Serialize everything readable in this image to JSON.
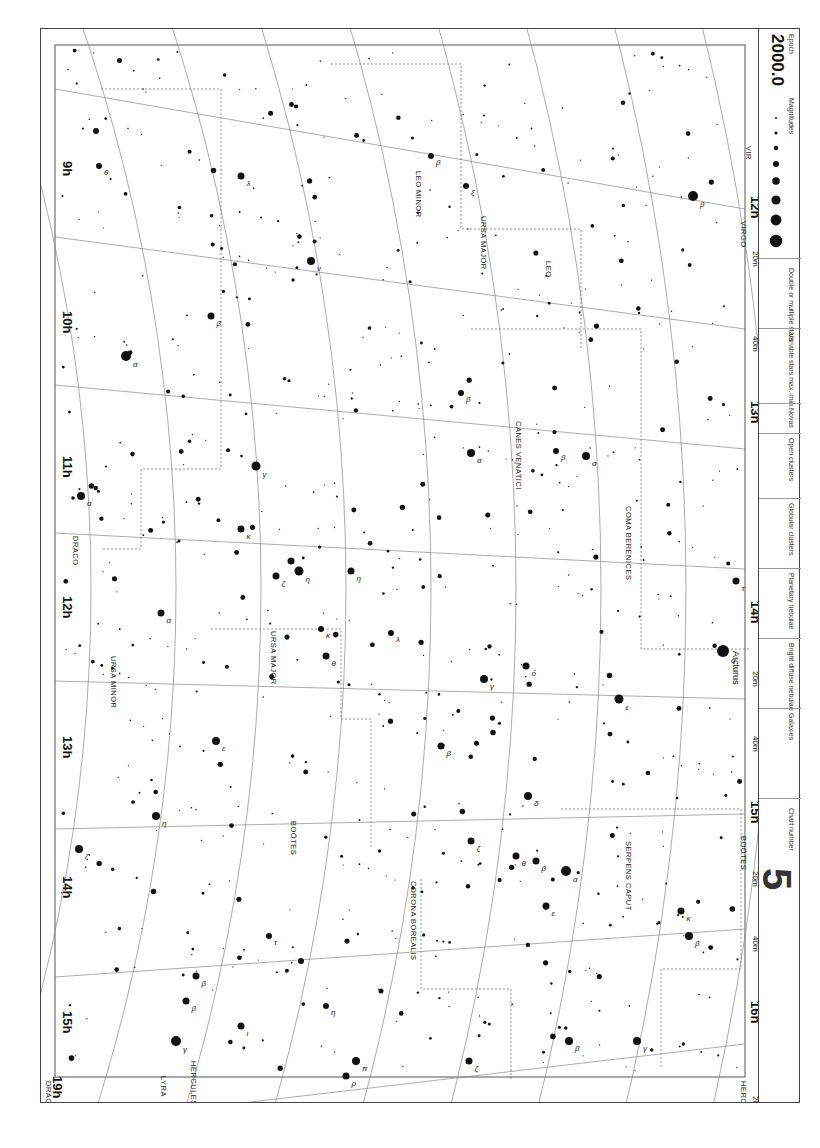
{
  "legend": {
    "epoch_label": "Epoch",
    "epoch_value": "2000.0",
    "magnitudes_label": "Magnitudes",
    "magnitudes": [
      "6",
      "5",
      "4",
      "3",
      "2",
      "1",
      "0",
      "-1"
    ],
    "double_label": "Double or multiple stars",
    "variable_label": "Variable stars max.-min.",
    "variable_ranges": [
      "6 – <6",
      "4 – <6",
      "4 – 5",
      "3 – 6"
    ],
    "novas_label": "Novas",
    "novas_example": "+N1901",
    "open_clusters_label": "Open clusters",
    "open_clusters": [
      "<30'",
      "> 30' drawn to scale"
    ],
    "globular_label": "Globular clusters",
    "globular": [
      "<5'",
      "5'-10'",
      ">10'"
    ],
    "planetary_label": "Planetary nebulae",
    "planetary": [
      "<30\"",
      "30\"-60\"",
      ">60\""
    ],
    "diffuse_label": "Bright diffuse nebulae",
    "diffuse": [
      "<10'",
      ">10' drawn to scale"
    ],
    "galaxies_label": "Galaxies",
    "galaxies": [
      "<10'",
      "10'-20'",
      "20'-30'",
      ">30' drawn to scale"
    ],
    "chart_number_label": "Chart number",
    "chart_number": "5"
  },
  "chart": {
    "ra_labels": [
      {
        "text": "9h",
        "x": 62,
        "y": 160
      },
      {
        "text": "10h",
        "x": 62,
        "y": 310
      },
      {
        "text": "11h",
        "x": 62,
        "y": 455
      },
      {
        "text": "12h",
        "x": 62,
        "y": 595
      },
      {
        "text": "13h",
        "x": 62,
        "y": 735
      },
      {
        "text": "14h",
        "x": 62,
        "y": 875
      },
      {
        "text": "15h",
        "x": 62,
        "y": 1010
      },
      {
        "text": "19h",
        "x": 52,
        "y": 1075
      }
    ],
    "ra_bottom_labels": [
      {
        "text": "12h",
        "x": 750,
        "y": 195
      },
      {
        "text": "13h",
        "x": 750,
        "y": 400
      },
      {
        "text": "14h",
        "x": 750,
        "y": 600
      },
      {
        "text": "15h",
        "x": 750,
        "y": 800
      },
      {
        "text": "16h",
        "x": 750,
        "y": 1000
      },
      {
        "text": "20m",
        "x": 752,
        "y": 250
      },
      {
        "text": "40m",
        "x": 752,
        "y": 335
      },
      {
        "text": "20m",
        "x": 752,
        "y": 670
      },
      {
        "text": "40m",
        "x": 752,
        "y": 735
      },
      {
        "text": "20m",
        "x": 752,
        "y": 870
      },
      {
        "text": "40m",
        "x": 752,
        "y": 935
      },
      {
        "text": "20m",
        "x": 752,
        "y": 1095
      }
    ],
    "dec_labels": [
      {
        "text": "+50°",
        "x": 100,
        "y": 1115
      },
      {
        "text": "+45°",
        "x": 205,
        "y": 1115
      },
      {
        "text": "+40°",
        "x": 290,
        "y": 1115
      },
      {
        "text": "+35°",
        "x": 370,
        "y": 1115
      },
      {
        "text": "+30°",
        "x": 460,
        "y": 1115
      },
      {
        "text": "+25°",
        "x": 545,
        "y": 1115
      },
      {
        "text": "+20°",
        "x": 625,
        "y": 1115
      },
      {
        "text": "+15°",
        "x": 700,
        "y": 1115
      },
      {
        "text": "+10°",
        "x": 760,
        "y": 1115
      }
    ],
    "constellations": [
      {
        "name": "DRACO",
        "x": 72,
        "y": 535,
        "rot": 90
      },
      {
        "name": "DRACO",
        "x": 45,
        "y": 1080,
        "rot": 90
      },
      {
        "name": "URSA MINOR",
        "x": 110,
        "y": 655,
        "rot": 90
      },
      {
        "name": "URSA MAJOR",
        "x": 270,
        "y": 630,
        "rot": 90
      },
      {
        "name": "BOÖTES",
        "x": 290,
        "y": 820,
        "rot": 90
      },
      {
        "name": "BOÖTES",
        "x": 740,
        "y": 835,
        "rot": 90
      },
      {
        "name": "LEO MINOR",
        "x": 415,
        "y": 170,
        "rot": 90
      },
      {
        "name": "URSA MAJOR",
        "x": 480,
        "y": 215,
        "rot": 90
      },
      {
        "name": "LEO",
        "x": 545,
        "y": 260,
        "rot": 90
      },
      {
        "name": "CANES VENATICI",
        "x": 515,
        "y": 420,
        "rot": 90
      },
      {
        "name": "COMA BERENICES",
        "x": 625,
        "y": 505,
        "rot": 90
      },
      {
        "name": "VIRGO",
        "x": 740,
        "y": 220,
        "rot": 90
      },
      {
        "name": "VIR",
        "x": 745,
        "y": 145,
        "rot": 90
      },
      {
        "name": "CORONA BOREALIS",
        "x": 410,
        "y": 880,
        "rot": 90
      },
      {
        "name": "SERPENS CAPUT",
        "x": 625,
        "y": 840,
        "rot": 90
      },
      {
        "name": "HERCULES",
        "x": 190,
        "y": 1060,
        "rot": 90
      },
      {
        "name": "HERCULES",
        "x": 740,
        "y": 1080,
        "rot": 90
      },
      {
        "name": "LYRA",
        "x": 160,
        "y": 1075,
        "rot": 90
      }
    ],
    "named_stars": [
      {
        "name": "Arcturus",
        "x": 722,
        "y": 650
      }
    ],
    "stars": [
      {
        "x": 125,
        "y": 355,
        "r": 5,
        "l": "α"
      },
      {
        "x": 80,
        "y": 495,
        "r": 4,
        "l": "α"
      },
      {
        "x": 160,
        "y": 612,
        "r": 3.5,
        "l": "α"
      },
      {
        "x": 255,
        "y": 465,
        "r": 4.5,
        "l": "γ"
      },
      {
        "x": 240,
        "y": 528,
        "r": 3.5,
        "l": "κ"
      },
      {
        "x": 290,
        "y": 560,
        "r": 3.5,
        "l": "ε"
      },
      {
        "x": 275,
        "y": 575,
        "r": 3.5,
        "l": "ζ"
      },
      {
        "x": 298,
        "y": 570,
        "r": 4.5,
        "l": "η"
      },
      {
        "x": 210,
        "y": 315,
        "r": 3.5,
        "l": "β"
      },
      {
        "x": 240,
        "y": 175,
        "r": 3.5,
        "l": "λ"
      },
      {
        "x": 310,
        "y": 260,
        "r": 4,
        "l": "ν"
      },
      {
        "x": 350,
        "y": 570,
        "r": 3.5,
        "l": "η"
      },
      {
        "x": 390,
        "y": 632,
        "r": 3,
        "l": "λ"
      },
      {
        "x": 320,
        "y": 628,
        "r": 3,
        "l": "κ"
      },
      {
        "x": 325,
        "y": 655,
        "r": 3.5,
        "l": "θ"
      },
      {
        "x": 430,
        "y": 155,
        "r": 3,
        "l": "β"
      },
      {
        "x": 465,
        "y": 185,
        "r": 3,
        "l": "ξ"
      },
      {
        "x": 470,
        "y": 452,
        "r": 4,
        "l": "α"
      },
      {
        "x": 460,
        "y": 392,
        "r": 3,
        "l": "β"
      },
      {
        "x": 555,
        "y": 450,
        "r": 3,
        "l": "β"
      },
      {
        "x": 585,
        "y": 455,
        "r": 4,
        "l": "α"
      },
      {
        "x": 692,
        "y": 195,
        "r": 5,
        "l": "β"
      },
      {
        "x": 735,
        "y": 580,
        "r": 3.5,
        "l": "τ"
      },
      {
        "x": 722,
        "y": 650,
        "r": 6,
        "l": "α"
      },
      {
        "x": 618,
        "y": 698,
        "r": 4.5,
        "l": "ε"
      },
      {
        "x": 525,
        "y": 665,
        "r": 3.5,
        "l": "ο"
      },
      {
        "x": 483,
        "y": 678,
        "r": 4,
        "l": "γ"
      },
      {
        "x": 440,
        "y": 745,
        "r": 3.5,
        "l": "β"
      },
      {
        "x": 527,
        "y": 795,
        "r": 4,
        "l": "δ"
      },
      {
        "x": 565,
        "y": 870,
        "r": 5,
        "l": "α"
      },
      {
        "x": 515,
        "y": 855,
        "r": 3.5,
        "l": "θ"
      },
      {
        "x": 535,
        "y": 860,
        "r": 3.5,
        "l": "β"
      },
      {
        "x": 545,
        "y": 905,
        "r": 3.5,
        "l": "ε"
      },
      {
        "x": 470,
        "y": 840,
        "r": 3.5,
        "l": "ζ"
      },
      {
        "x": 468,
        "y": 1060,
        "r": 3.5,
        "l": "ζ"
      },
      {
        "x": 568,
        "y": 1040,
        "r": 4,
        "l": "β"
      },
      {
        "x": 636,
        "y": 1040,
        "r": 4,
        "l": "γ"
      },
      {
        "x": 688,
        "y": 935,
        "r": 4,
        "l": "β"
      },
      {
        "x": 680,
        "y": 910,
        "r": 3.5,
        "l": "κ"
      },
      {
        "x": 215,
        "y": 740,
        "r": 4,
        "l": "ε"
      },
      {
        "x": 155,
        "y": 815,
        "r": 4,
        "l": "η"
      },
      {
        "x": 78,
        "y": 848,
        "r": 4,
        "l": "ζ"
      },
      {
        "x": 175,
        "y": 1040,
        "r": 5,
        "l": "γ"
      },
      {
        "x": 195,
        "y": 975,
        "r": 3.5,
        "l": "β"
      },
      {
        "x": 185,
        "y": 1000,
        "r": 3.5,
        "l": "β"
      },
      {
        "x": 355,
        "y": 1060,
        "r": 4,
        "l": "π"
      },
      {
        "x": 345,
        "y": 1075,
        "r": 3.5,
        "l": "ρ"
      },
      {
        "x": 240,
        "y": 1025,
        "r": 3.5,
        "l": "ι"
      },
      {
        "x": 95,
        "y": 130,
        "r": 3,
        "l": ""
      },
      {
        "x": 98,
        "y": 165,
        "r": 3,
        "l": "θ"
      },
      {
        "x": 268,
        "y": 935,
        "r": 3,
        "l": "τ"
      },
      {
        "x": 300,
        "y": 960,
        "r": 3,
        "l": ""
      },
      {
        "x": 325,
        "y": 1005,
        "r": 3,
        "l": "η"
      },
      {
        "x": 380,
        "y": 990,
        "r": 2.5,
        "l": ""
      }
    ],
    "small_star_seed": 2024
  }
}
